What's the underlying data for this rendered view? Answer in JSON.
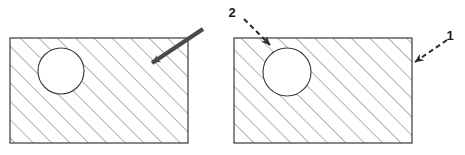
{
  "figure": {
    "width": 465,
    "height": 155,
    "background_color": "#ffffff"
  },
  "style": {
    "outline_color": "#3a3a3a",
    "outline_width": 1.2,
    "hatch_color": "#555555",
    "hatch_width": 0.9,
    "hatch_angle_deg": 45,
    "hatch_spacing_px": 13,
    "hole_fill": "#ffffff",
    "solid_arrow_color": "#4a4a4a",
    "dashed_arrow_color": "#2b2b2b",
    "label_color": "#1a1a1a"
  },
  "panels": [
    {
      "id": "left-panel",
      "name": "left-hatched-rectangle-panel",
      "rect": {
        "x": 10,
        "y": 38,
        "width": 178,
        "height": 105
      },
      "hole": {
        "cx": 61,
        "cy": 71,
        "r": 23
      },
      "annotations": [
        {
          "id": "left-solid-arrow",
          "name": "solid-pointer-arrow",
          "style": "solid",
          "from": {
            "x": 203,
            "y": 29
          },
          "to": {
            "x": 152,
            "y": 63
          },
          "label": ""
        }
      ]
    },
    {
      "id": "right-panel",
      "name": "right-hatched-rectangle-panel",
      "rect": {
        "x": 234,
        "y": 38,
        "width": 178,
        "height": 105
      },
      "hole": {
        "cx": 287,
        "cy": 72,
        "r": 24
      },
      "annotations": [
        {
          "id": "callout-2",
          "name": "callout-arrow-2",
          "style": "dashed",
          "from": {
            "x": 244,
            "y": 19
          },
          "to": {
            "x": 270,
            "y": 45
          },
          "label": "2",
          "label_pos": {
            "x": 232,
            "y": 17
          }
        },
        {
          "id": "callout-1",
          "name": "callout-arrow-1",
          "style": "dashed",
          "from": {
            "x": 447,
            "y": 40
          },
          "to": {
            "x": 415,
            "y": 62
          },
          "label": "1",
          "label_pos": {
            "x": 450,
            "y": 40
          }
        }
      ]
    }
  ],
  "labels": {
    "callout_one": "1",
    "callout_two": "2"
  }
}
